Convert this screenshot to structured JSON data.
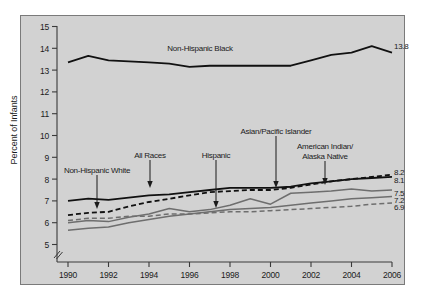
{
  "chart_data": {
    "type": "line",
    "title": "",
    "xlabel": "",
    "ylabel": "Percent of Infants",
    "x": [
      1990,
      1991,
      1992,
      1993,
      1994,
      1995,
      1996,
      1997,
      1998,
      1999,
      2000,
      2001,
      2002,
      2003,
      2004,
      2005,
      2006
    ],
    "xlim": [
      1990,
      2006
    ],
    "ylim": [
      5,
      15
    ],
    "yticks": [
      5,
      6,
      7,
      8,
      9,
      10,
      11,
      12,
      13,
      14,
      15
    ],
    "xticks": [
      1990,
      1992,
      1994,
      1996,
      1998,
      2000,
      2002,
      2004,
      2006
    ],
    "axis_break": true,
    "grid": false,
    "legend": "annotations-on-plot",
    "series": [
      {
        "name": "Non-Hispanic Black",
        "style": "solid",
        "color": "#111111",
        "width": 1.8,
        "end_label": "13.8",
        "values": [
          13.35,
          13.65,
          13.45,
          13.4,
          13.35,
          13.3,
          13.15,
          13.2,
          13.2,
          13.2,
          13.2,
          13.2,
          13.45,
          13.7,
          13.8,
          14.1,
          13.8
        ]
      },
      {
        "name": "American Indian/Alaska Native",
        "style": "dashed",
        "color": "#111111",
        "width": 1.8,
        "end_label": "8.2",
        "values": [
          6.35,
          6.45,
          6.5,
          6.75,
          6.95,
          7.1,
          7.25,
          7.4,
          7.45,
          7.5,
          7.5,
          7.6,
          7.75,
          7.9,
          8.0,
          8.1,
          8.2
        ]
      },
      {
        "name": "All Races",
        "style": "solid",
        "color": "#111111",
        "width": 1.8,
        "end_label": "8.1",
        "values": [
          7.0,
          7.1,
          7.05,
          7.15,
          7.25,
          7.3,
          7.4,
          7.5,
          7.6,
          7.6,
          7.6,
          7.65,
          7.8,
          7.9,
          8.0,
          8.05,
          8.1
        ]
      },
      {
        "name": "Hispanic",
        "style": "solid",
        "color": "#6e6e6e",
        "width": 1.5,
        "end_label": "7.5",
        "values": [
          6.0,
          6.1,
          6.05,
          6.25,
          6.4,
          6.65,
          6.5,
          6.6,
          6.8,
          7.1,
          6.85,
          7.35,
          7.4,
          7.45,
          7.55,
          7.45,
          7.5
        ]
      },
      {
        "name": "Non-Hispanic White",
        "style": "solid",
        "color": "#6e6e6e",
        "width": 1.5,
        "end_label": "7.2",
        "values": [
          5.65,
          5.75,
          5.8,
          6.0,
          6.15,
          6.3,
          6.4,
          6.5,
          6.6,
          6.65,
          6.7,
          6.8,
          6.9,
          7.0,
          7.1,
          7.15,
          7.2
        ]
      },
      {
        "name": "Asian/Pacific Islander",
        "style": "dashed",
        "color": "#6e6e6e",
        "width": 1.5,
        "end_label": "6.9",
        "values": [
          6.1,
          6.2,
          6.2,
          6.3,
          6.3,
          6.4,
          6.4,
          6.45,
          6.5,
          6.5,
          6.55,
          6.6,
          6.65,
          6.7,
          6.75,
          6.85,
          6.9
        ]
      }
    ],
    "annotations": [
      {
        "text": "Non-Hispanic Black",
        "kind": "plain"
      },
      {
        "text": "Non-Hispanic White",
        "kind": "leader-arrow"
      },
      {
        "text": "All Races",
        "kind": "leader-arrow"
      },
      {
        "text": "Hispanic",
        "kind": "leader-arrow"
      },
      {
        "text": "Asian/Pacific Islander",
        "kind": "leader-arrow"
      },
      {
        "text": "American Indian/",
        "text2": "Alaska Native",
        "kind": "leader-arrow"
      }
    ]
  },
  "axis": {
    "y_title": "Percent of Infants",
    "y_ticks": [
      "15",
      "14",
      "13",
      "12",
      "11",
      "10",
      "9",
      "8",
      "7",
      "6",
      "5"
    ],
    "x_ticks": [
      "1990",
      "1992",
      "1994",
      "1996",
      "1998",
      "2000",
      "2002",
      "2004",
      "2006"
    ]
  },
  "end_labels": {
    "black": "13.8",
    "aian": "8.2",
    "all": "8.1",
    "hispanic": "7.5",
    "white": "7.2",
    "api": "6.9"
  },
  "annotations": {
    "nh_black": "Non-Hispanic Black",
    "nh_white": "Non-Hispanic White",
    "all_races": "All Races",
    "hispanic": "Hispanic",
    "api": "Asian/Pacific Islander",
    "aian_line1": "American Indian/",
    "aian_line2": "Alaska Native"
  },
  "colors": {
    "panel": "#d2d2d2",
    "dark_series": "#111111",
    "gray_series": "#6e6e6e",
    "frame": "#7a7a7a"
  }
}
